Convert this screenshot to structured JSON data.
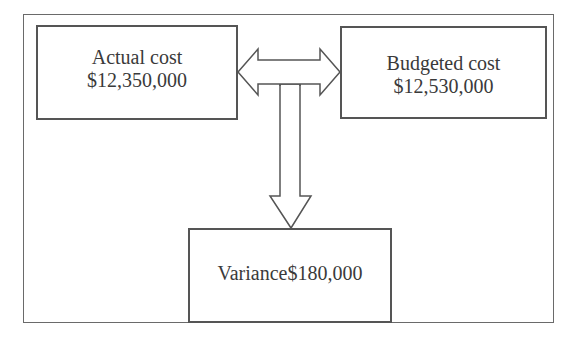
{
  "diagram": {
    "nodes": [
      {
        "id": "actual",
        "label": "Actual cost",
        "value": "$12,350,000"
      },
      {
        "id": "budgeted",
        "label": "Budgeted cost",
        "value": "$12,530,000"
      },
      {
        "id": "variance",
        "label": "Variance$180,000"
      }
    ],
    "edges": [
      {
        "from": "actual",
        "to": "budgeted",
        "type": "double-arrow"
      },
      {
        "from": "comparison",
        "to": "variance",
        "type": "down-arrow"
      }
    ],
    "colors": {
      "stroke": "#555555",
      "text": "#3a3a3a",
      "background": "#ffffff"
    }
  }
}
